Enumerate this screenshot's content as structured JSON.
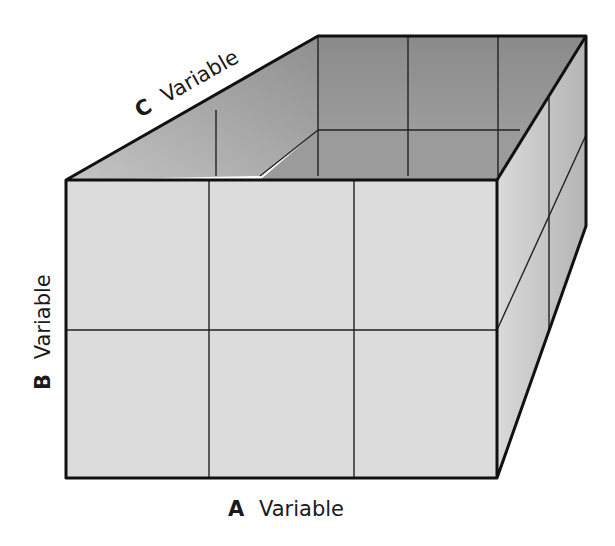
{
  "diagram": {
    "type": "three-way factorial design cube",
    "labels": {
      "a": {
        "letter": "A",
        "word": "Variable"
      },
      "b": {
        "letter": "B",
        "word": "Variable"
      },
      "c": {
        "letter": "C",
        "word": "Variable"
      }
    },
    "grid": {
      "columns_A": 3,
      "rows_B": 2,
      "depth_C": 2
    },
    "colors": {
      "front_face": "#dcdcdc",
      "right_face": "#c8c8c8",
      "inner_back": "#8e8e8e",
      "inner_left": "#a8a8a8",
      "inner_floor": "#9a9a9a",
      "edge": "#111111"
    }
  }
}
